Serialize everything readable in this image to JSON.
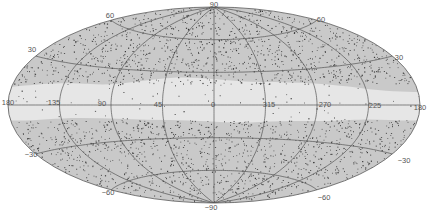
{
  "map": {
    "projection": "Aitoff (galactic coordinates)",
    "colors": {
      "background": "#ffffff",
      "sky": "#c9c9c9",
      "galactic_band": "#e6e6e6",
      "grid": "#555555",
      "points": "#3a3a3a",
      "outline": "#555555"
    },
    "longitude_labels": [
      {
        "text": "180",
        "x": 8,
        "y": 102
      },
      {
        "text": "135",
        "x": 54,
        "y": 102
      },
      {
        "text": "90",
        "x": 102,
        "y": 103
      },
      {
        "text": "45",
        "x": 158,
        "y": 104
      },
      {
        "text": "0",
        "x": 213,
        "y": 104
      },
      {
        "text": "315",
        "x": 269,
        "y": 104
      },
      {
        "text": "270",
        "x": 325,
        "y": 104
      },
      {
        "text": "225",
        "x": 375,
        "y": 105
      },
      {
        "text": "180",
        "x": 420,
        "y": 107
      }
    ],
    "latitude_labels": [
      {
        "text": "90",
        "x": 214,
        "y": 4
      },
      {
        "text": "60",
        "x": 110,
        "y": 15
      },
      {
        "text": "60",
        "x": 321,
        "y": 19
      },
      {
        "text": "30",
        "x": 32,
        "y": 49
      },
      {
        "text": "30",
        "x": 399,
        "y": 57
      },
      {
        "text": "-30",
        "x": 31,
        "y": 154
      },
      {
        "text": "-30",
        "x": 404,
        "y": 160
      },
      {
        "text": "-60",
        "x": 108,
        "y": 192
      },
      {
        "text": "-60",
        "x": 324,
        "y": 197
      },
      {
        "text": "-90",
        "x": 211,
        "y": 207
      }
    ]
  }
}
